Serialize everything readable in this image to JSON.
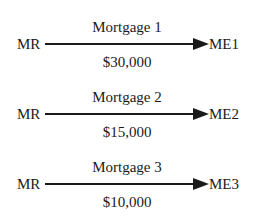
{
  "diagram": {
    "edges": [
      {
        "title": "Mortgage 1",
        "source": "MR",
        "target": "ME1",
        "amount": "$30,000"
      },
      {
        "title": "Mortgage 2",
        "source": "MR",
        "target": "ME2",
        "amount": "$15,000"
      },
      {
        "title": "Mortgage 3",
        "source": "MR",
        "target": "ME3",
        "amount": "$10,000"
      }
    ],
    "colors": {
      "line": "#1a1a1a",
      "text": "#1a1a1a",
      "background": "#ffffff"
    }
  }
}
